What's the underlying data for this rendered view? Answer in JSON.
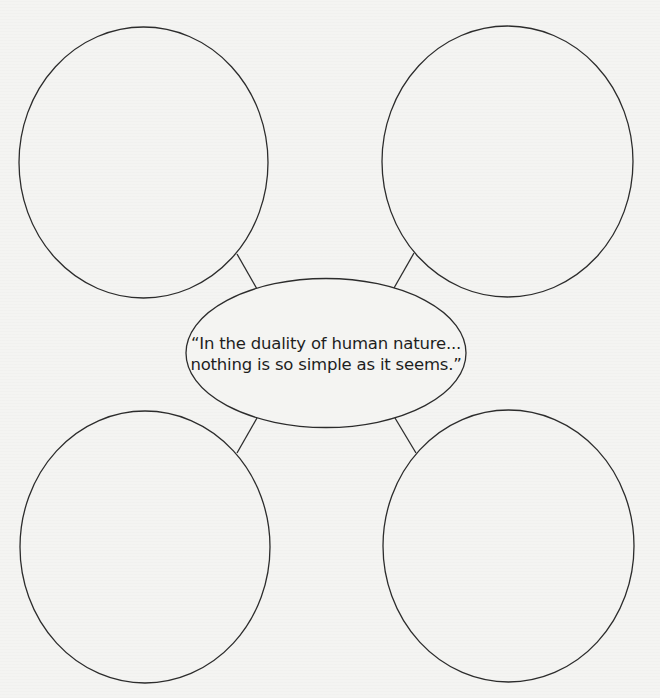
{
  "diagram": {
    "type": "idea-web",
    "background_color": "#f4f4f2",
    "stroke_color": "#2c2c2c",
    "center": {
      "shape": "ellipse",
      "cx": 326,
      "cy": 353,
      "rx": 140,
      "ry": 74.5,
      "text_lines": [
        "“In the duality of human nature...",
        "nothing is so simple as it seems.”"
      ]
    },
    "nodes": [
      {
        "id": "top-left",
        "shape": "ellipse",
        "cx": 143.5,
        "cy": 162.5,
        "rx": 124.5,
        "ry": 135.5,
        "label": ""
      },
      {
        "id": "top-right",
        "shape": "ellipse",
        "cx": 507.5,
        "cy": 161.5,
        "rx": 125.5,
        "ry": 135.5,
        "label": ""
      },
      {
        "id": "bottom-left",
        "shape": "ellipse",
        "cx": 145,
        "cy": 547,
        "rx": 125,
        "ry": 136,
        "label": ""
      },
      {
        "id": "bottom-right",
        "shape": "ellipse",
        "cx": 508.5,
        "cy": 546,
        "rx": 125.5,
        "ry": 136,
        "label": ""
      }
    ],
    "connectors": [
      {
        "id": "top-left",
        "x1": 237,
        "y1": 254,
        "x2": 257,
        "y2": 289
      },
      {
        "id": "top-right",
        "x1": 414,
        "y1": 253,
        "x2": 394,
        "y2": 288
      },
      {
        "id": "bottom-left",
        "x1": 257,
        "y1": 418,
        "x2": 237,
        "y2": 453
      },
      {
        "id": "bottom-right",
        "x1": 395,
        "y1": 418,
        "x2": 416,
        "y2": 453
      }
    ]
  }
}
